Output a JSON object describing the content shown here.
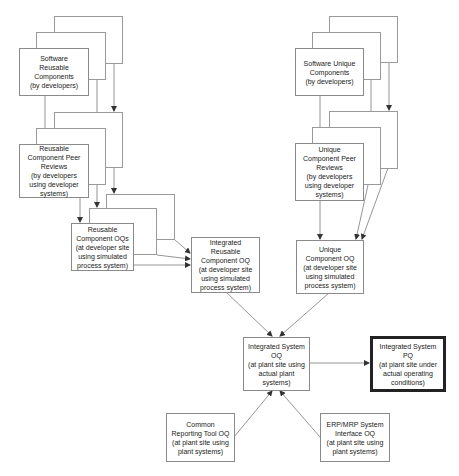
{
  "diagram": {
    "type": "flowchart",
    "title": "",
    "nodes": [
      {
        "id": "sw_reusable",
        "lines": [
          "Software",
          "Reusable",
          "Components",
          "(by developers)"
        ],
        "stacked": true
      },
      {
        "id": "reusable_peer",
        "lines": [
          "Reusable",
          "Component Peer",
          "Reviews",
          "(by developers",
          "using developer",
          "systems)"
        ],
        "stacked": true
      },
      {
        "id": "reusable_oq",
        "lines": [
          "Reusable",
          "Component OQs",
          "(at developer site",
          "using simulated",
          "process system)"
        ],
        "stacked": true
      },
      {
        "id": "integrated_reusable_oq",
        "lines": [
          "Integrated",
          "Reusable",
          "Component OQ",
          "(at developer site",
          "using simulated",
          "process system)"
        ],
        "stacked": false
      },
      {
        "id": "sw_unique",
        "lines": [
          "Software Unique",
          "Components",
          "(by developers)"
        ],
        "stacked": true
      },
      {
        "id": "unique_peer",
        "lines": [
          "Unique",
          "Component Peer",
          "Reviews",
          "(by developers",
          "using developer",
          "systems)"
        ],
        "stacked": true
      },
      {
        "id": "unique_oq",
        "lines": [
          "Unique",
          "Component OQ",
          "(at developer site",
          "using simulated",
          "process system)"
        ],
        "stacked": false
      },
      {
        "id": "integrated_system_oq",
        "lines": [
          "Integrated System",
          "OQ",
          "(at plant site using",
          "actual plant",
          "systems)"
        ],
        "stacked": false
      },
      {
        "id": "integrated_system_pq",
        "lines": [
          "Integrated System",
          "PQ",
          "(at plant site under",
          "actual operating",
          "conditions)"
        ],
        "stacked": false,
        "emphasis": "thick-border"
      },
      {
        "id": "common_reporting_oq",
        "lines": [
          "Common",
          "Reporting Tool OQ",
          "(at plant site using",
          "plant systems)"
        ],
        "stacked": false
      },
      {
        "id": "erp_mrp_oq",
        "lines": [
          "ERP/MRP System",
          "Interface OQ",
          "(at plant site using",
          "plant systems)"
        ],
        "stacked": false
      }
    ],
    "edges": [
      {
        "from": "sw_reusable",
        "to": "reusable_peer"
      },
      {
        "from": "reusable_peer",
        "to": "reusable_oq"
      },
      {
        "from": "reusable_oq",
        "to": "integrated_reusable_oq"
      },
      {
        "from": "sw_unique",
        "to": "unique_peer"
      },
      {
        "from": "unique_peer",
        "to": "unique_oq"
      },
      {
        "from": "integrated_reusable_oq",
        "to": "integrated_system_oq"
      },
      {
        "from": "unique_oq",
        "to": "integrated_system_oq"
      },
      {
        "from": "integrated_system_oq",
        "to": "integrated_system_pq"
      },
      {
        "from": "common_reporting_oq",
        "to": "integrated_system_oq"
      },
      {
        "from": "erp_mrp_oq",
        "to": "integrated_system_oq"
      }
    ]
  },
  "colors": {
    "line": "#7a7a7a",
    "border": "#8a8a8a",
    "emphasis_border": "#222222",
    "background": "#ffffff"
  }
}
